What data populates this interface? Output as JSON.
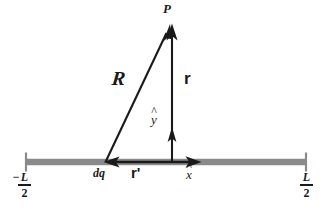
{
  "figure": {
    "background_color": "#ffffff",
    "rod": {
      "color": "#8a8a8a",
      "tick_color": "#8a8a8a",
      "left_x": 25,
      "right_x": 307,
      "y": 162
    },
    "ink_color": "#1a1a1a"
  },
  "labels": {
    "point_p": "P",
    "vector_R": "R",
    "vector_r": "r",
    "unit_y": "y",
    "unit_x": "x",
    "charge_element": "dq",
    "vector_r_prime": "r",
    "r_prime_tick": "'",
    "hat_mark": "^",
    "minus_sign": "−",
    "left_end_numerator": "L",
    "left_end_denominator": "2",
    "right_end_numerator": "L",
    "right_end_denominator": "2"
  },
  "geometry": {
    "point_p": {
      "x": 170,
      "y": 25
    },
    "charge_element_dq": {
      "x": 105,
      "y": 162
    },
    "field_point_foot": {
      "x": 172,
      "y": 162
    },
    "vector_R": {
      "from": [
        105,
        162
      ],
      "to": [
        170,
        25
      ]
    },
    "vector_r": {
      "from": [
        172,
        162
      ],
      "to": [
        172,
        25
      ]
    },
    "unit_y_arrow": {
      "from": [
        172,
        162
      ],
      "to": [
        172,
        128
      ]
    },
    "unit_x_arrow": {
      "from": [
        172,
        162
      ],
      "to": [
        200,
        162
      ]
    },
    "r_prime_arrow": {
      "from": [
        172,
        162
      ],
      "to": [
        108,
        162
      ]
    }
  }
}
